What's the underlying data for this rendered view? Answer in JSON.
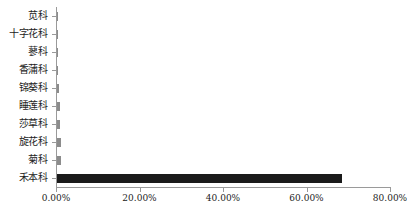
{
  "chart_data": {
    "type": "bar",
    "orientation": "horizontal",
    "title": "",
    "subtitle": "",
    "xlabel": "",
    "ylabel": "",
    "categories": [
      "苋科",
      "十字花科",
      "蓼科",
      "香蒲科",
      "锦葵科",
      "睡莲科",
      "莎草科",
      "旋花科",
      "菊科",
      "禾本科"
    ],
    "values": [
      0.45,
      0.45,
      0.45,
      0.45,
      0.6,
      0.95,
      1.0,
      1.3,
      1.3,
      68.5
    ],
    "value_format": "percent",
    "xlim": [
      0,
      80
    ],
    "x_tick_values": [
      0,
      20,
      40,
      60,
      80
    ],
    "x_tick_labels": [
      "0.00%",
      "20.00%",
      "40.00%",
      "60.00%",
      "80.00%"
    ],
    "grid": false,
    "legend": false,
    "legend_position": "none",
    "colors": {
      "bar": "#1a1a1a",
      "bar_small": "#8c8c8c",
      "axis": "#9a9a9a",
      "text": "#1c1c1c",
      "background": "#ffffff"
    }
  }
}
